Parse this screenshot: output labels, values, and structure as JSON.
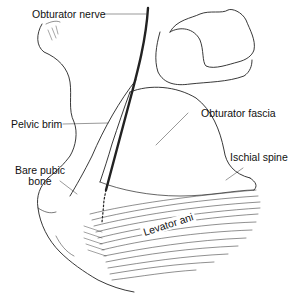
{
  "diagram": {
    "type": "anatomical-illustration",
    "labels": {
      "obturator_nerve": "Obturator nerve",
      "pelvic_brim": "Pelvic brim",
      "obturator_fascia": "Obturator fascia",
      "bare_pubic_bone_1": "Bare pubic",
      "bare_pubic_bone_2": "bone",
      "ischial_spine": "Ischial spine",
      "levator_ani": "Levator ani"
    }
  }
}
